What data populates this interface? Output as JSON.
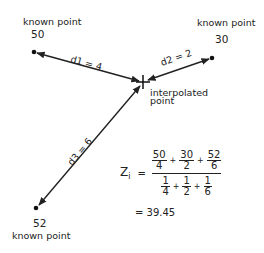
{
  "diagram": {
    "known_points": [
      {
        "label": "known point",
        "value": "50",
        "x": 34,
        "y": 52
      },
      {
        "label": "known point",
        "value": "30",
        "x": 212,
        "y": 58
      },
      {
        "label": "known point",
        "value": "52",
        "x": 36,
        "y": 208
      }
    ],
    "interpolated_point": {
      "label_line1": "interpolated",
      "label_line2": "point",
      "x": 143,
      "y": 82
    },
    "distances": [
      {
        "label": "d1 = 4"
      },
      {
        "label": "d2 = 2"
      },
      {
        "label": "d3 = 6"
      }
    ],
    "formula": {
      "lhs": "Z",
      "lhs_sub": "i",
      "equals": "=",
      "numerator": [
        {
          "num": "50",
          "den": "4"
        },
        {
          "num": "30",
          "den": "2"
        },
        {
          "num": "52",
          "den": "6"
        }
      ],
      "denominator": [
        {
          "num": "1",
          "den": "4"
        },
        {
          "num": "1",
          "den": "2"
        },
        {
          "num": "1",
          "den": "6"
        }
      ],
      "plus": "+",
      "result": "= 39.45"
    },
    "colors": {
      "ink": "#222222",
      "background": "#ffffff"
    }
  }
}
